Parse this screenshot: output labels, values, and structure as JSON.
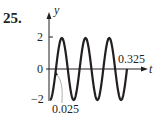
{
  "problem": {
    "number": "25."
  },
  "chart_data": {
    "type": "line",
    "title": "",
    "xlabel": "t",
    "ylabel": "y",
    "function": "y = -2 cos(20*pi*t)",
    "amplitude": 2,
    "period": 0.1,
    "x_range": [
      0,
      0.325
    ],
    "ylim": [
      -2,
      2
    ],
    "y_ticks": [
      {
        "value": 2,
        "label": "2"
      },
      {
        "value": 0,
        "label": "0"
      },
      {
        "value": -2,
        "label": "−2"
      }
    ],
    "annotations": [
      {
        "text": "0.025",
        "x": 0.025,
        "y": 0,
        "note": "first zero crossing"
      },
      {
        "text": "0.325",
        "x": 0.325,
        "y": 0,
        "note": "end of curve"
      }
    ],
    "x": [
      0,
      0.025,
      0.05,
      0.075,
      0.1,
      0.125,
      0.15,
      0.175,
      0.2,
      0.225,
      0.25,
      0.275,
      0.3,
      0.325
    ],
    "values": [
      -2,
      0,
      2,
      0,
      -2,
      0,
      2,
      0,
      -2,
      0,
      2,
      0,
      -2,
      0
    ],
    "grid": false,
    "legend": null
  },
  "labels": {
    "y_axis": "y",
    "t_axis": "t",
    "tick_2": "2",
    "tick_0": "0",
    "tick_neg2": "−2",
    "annot_start": "0.025",
    "annot_end": "0.325"
  },
  "colors": {
    "curve": "#231f20",
    "axis": "#231f20",
    "leader": "#8a8a8a"
  }
}
